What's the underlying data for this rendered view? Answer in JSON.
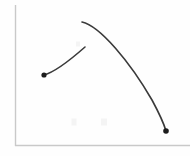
{
  "figure": {
    "title": "",
    "background_color": "#fefefe",
    "width": 190,
    "height": 156
  },
  "axes": {
    "name": "axis-frame",
    "color": "#c9c9c9",
    "stroke_width": 1.4,
    "origin": {
      "x": 15,
      "y": 146
    },
    "y_axis_top": {
      "x": 15,
      "y": 5
    },
    "x_axis_right": {
      "x": 190,
      "y": 146
    },
    "x_tick_labels": [],
    "y_tick_labels": [],
    "xlabel": "",
    "ylabel": "",
    "grid": false
  },
  "chart_data": {
    "type": "line",
    "title": "",
    "subtitle": "",
    "xlabel": "",
    "ylabel": "",
    "xlim": [
      0,
      190
    ],
    "ylim": [
      0,
      156
    ],
    "grid": false,
    "legend": null,
    "legend_position": "none",
    "note": "Hand-drawn style sketch of two unlabeled curves on a plain L-shaped axis frame. Values are pixel coordinates read off the image (y increases downward).",
    "series": [
      {
        "name": "left-rising-curve",
        "color": "#3a3a3a",
        "stroke_width": 1.6,
        "shape": "concave-down rising arc",
        "path": "M 44 75 C 55 72, 68 62, 85 47",
        "points": [
          {
            "x": 44,
            "y": 75
          },
          {
            "x": 55,
            "y": 70
          },
          {
            "x": 66,
            "y": 62
          },
          {
            "x": 76,
            "y": 54
          },
          {
            "x": 85,
            "y": 47
          }
        ],
        "markers": [
          {
            "name": "left-curve-start-dot",
            "x": 44,
            "y": 75,
            "r": 2.6,
            "color": "#1c1c1c"
          }
        ]
      },
      {
        "name": "right-falling-curve",
        "color": "#3a3a3a",
        "stroke_width": 1.6,
        "shape": "concave-down falling arc from apex",
        "path": "M 82 22 C 100 26, 130 62, 152 100 C 159 113, 164 124, 166 131",
        "points": [
          {
            "x": 82,
            "y": 22
          },
          {
            "x": 95,
            "y": 28
          },
          {
            "x": 110,
            "y": 44
          },
          {
            "x": 125,
            "y": 63
          },
          {
            "x": 140,
            "y": 86
          },
          {
            "x": 153,
            "y": 108
          },
          {
            "x": 166,
            "y": 131
          }
        ],
        "markers": [
          {
            "name": "right-curve-end-dot",
            "x": 166,
            "y": 131,
            "r": 2.8,
            "color": "#1c1c1c"
          }
        ]
      }
    ],
    "faint_marks": [
      {
        "name": "faint-smudge-upper",
        "x": 78,
        "y": 44,
        "w": 4,
        "h": 5
      },
      {
        "name": "faint-smudge-lower-left",
        "x": 74,
        "y": 122,
        "w": 5,
        "h": 7
      },
      {
        "name": "faint-smudge-lower-right",
        "x": 104,
        "y": 122,
        "w": 6,
        "h": 7
      }
    ]
  }
}
